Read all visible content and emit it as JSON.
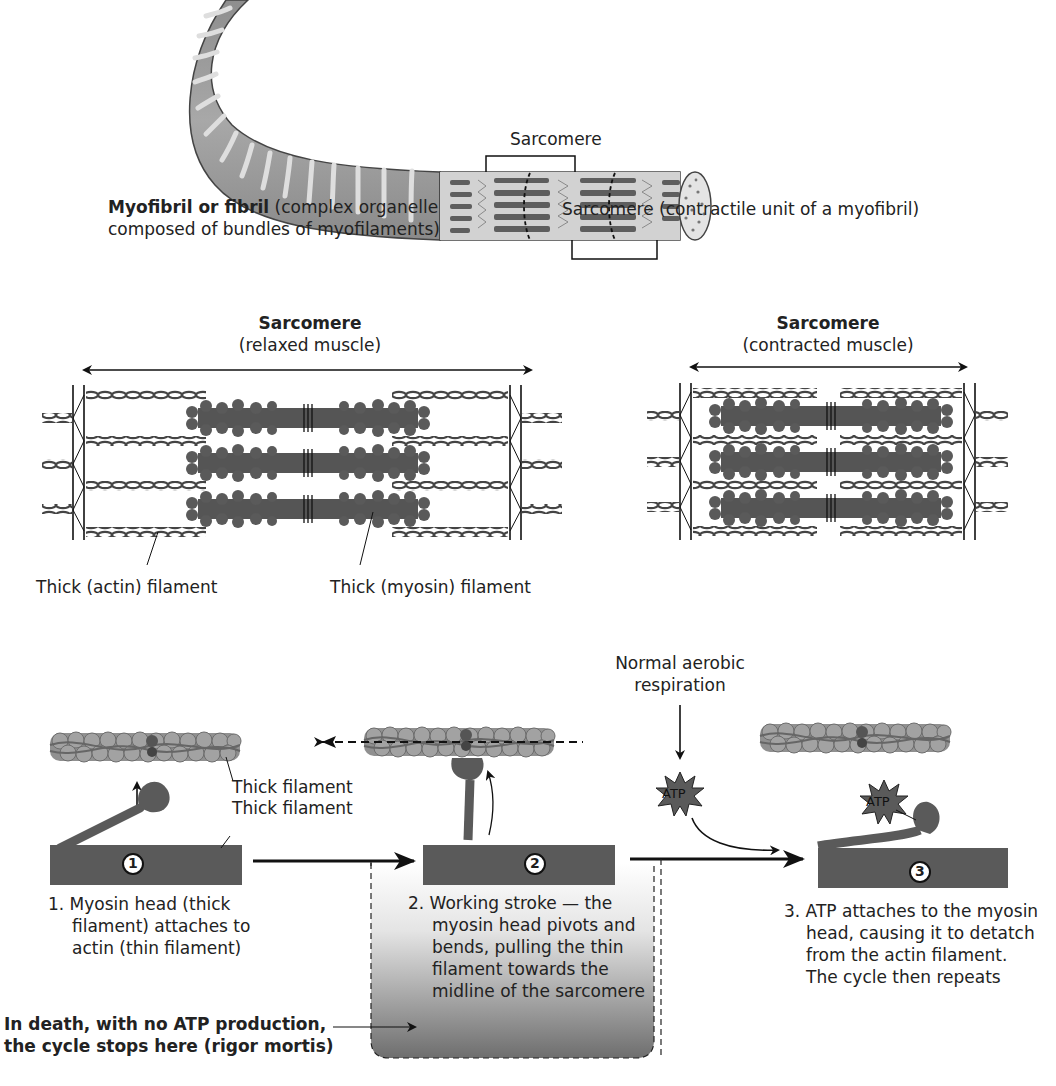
{
  "panel_myofibril": {
    "sarcomere_top_label": "Sarcomere",
    "myofibril_title_bold": "Myofibril or fibril",
    "myofibril_desc_1": " (complex organelle",
    "myofibril_desc_2": "composed of bundles of myofilaments)",
    "sarcomere_bottom_label": "Sarcomere (contractile unit of a myofibril)"
  },
  "panel_relaxed": {
    "title": "Sarcomere",
    "subtitle": "(relaxed muscle)",
    "actin_label": "Thick (actin) filament",
    "myosin_label": "Thick (myosin) filament"
  },
  "panel_contracted": {
    "title": "Sarcomere",
    "subtitle": "(contracted muscle)"
  },
  "cycle": {
    "respiration_label_1": "Normal aerobic",
    "respiration_label_2": "respiration",
    "atp_label": "ATP",
    "step1": {
      "number": "1",
      "filament_label_1": "Thick filament",
      "filament_label_2": "Thick filament",
      "text_1": "1. Myosin head (thick",
      "text_2": "filament) attaches to",
      "text_3": "actin (thin filament)"
    },
    "step2": {
      "number": "2",
      "text_1": "2. Working stroke — the",
      "text_2": "myosin head pivots and",
      "text_3": "bends, pulling the thin",
      "text_4": "filament towards the",
      "text_5": "midline of the sarcomere"
    },
    "step3": {
      "number": "3",
      "text_1": "3. ATP attaches to the myosin",
      "text_2": "head, causing it to detatch",
      "text_3": "from the actin filament.",
      "text_4": "The cycle then repeats"
    },
    "rigor_note_1": "In death, with no ATP production,",
    "rigor_note_2": "the cycle stops here (rigor mortis)"
  },
  "colors": {
    "filament_dark": "#4a4a4a",
    "thick_filament": "#555555",
    "actin_bead": "#8c8c8c",
    "fibril_grey": "#9a9a9a",
    "fibril_light": "#d8d8d8",
    "gradient_top": "#ffffff",
    "gradient_bottom": "#6e6e6e"
  }
}
